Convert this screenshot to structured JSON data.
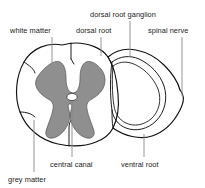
{
  "figure": {
    "colors": {
      "grey_matter": "#8f8f8f",
      "white_matter": "#ffffff",
      "stipple": "#3a3a3a",
      "outline": "#111111",
      "leader": "#8b8b8b",
      "label_text": "#1a1a1a",
      "background": "#ffffff"
    },
    "labels": [
      {
        "id": "white-matter",
        "text": "white matter",
        "x": 10,
        "y": 33,
        "anchor": "start"
      },
      {
        "id": "dorsal-root",
        "text": "dorsal root",
        "x": 76,
        "y": 33,
        "anchor": "start"
      },
      {
        "id": "dorsal-root-ganglion",
        "text": "dorsal root ganglion",
        "x": 90,
        "y": 17,
        "anchor": "start"
      },
      {
        "id": "spinal-nerve",
        "text": "spinal nerve",
        "x": 148,
        "y": 33,
        "anchor": "start"
      },
      {
        "id": "central-canal",
        "text": "central canal",
        "x": 50,
        "y": 164,
        "anchor": "start"
      },
      {
        "id": "ventral-root",
        "text": "ventral root",
        "x": 121,
        "y": 164,
        "anchor": "start"
      },
      {
        "id": "grey-matter",
        "text": "grey matter",
        "x": 8,
        "y": 180,
        "anchor": "start"
      }
    ]
  }
}
